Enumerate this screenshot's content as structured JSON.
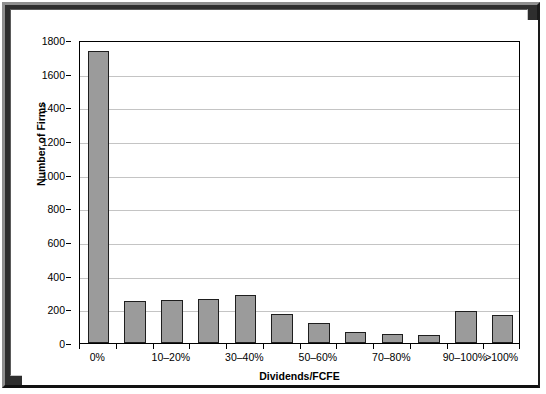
{
  "chart_data": {
    "type": "bar",
    "title": "",
    "xlabel": "Dividends/FCFE",
    "ylabel": "Number of Firms",
    "ylim": [
      0,
      1800
    ],
    "ytick_values": [
      0,
      200,
      400,
      600,
      800,
      1000,
      1200,
      1400,
      1600,
      1800
    ],
    "ytick_labels": [
      "0",
      "200",
      "400",
      "600",
      "800",
      "1000",
      "1200",
      "1400",
      "1600",
      "1800"
    ],
    "grid": true,
    "legend": false,
    "bar_color": "#9b9b9b",
    "bar_edge_color": "#1e1e1e",
    "categories": [
      "0%",
      "0-10%",
      "10-20%",
      "20-30%",
      "30-40%",
      "40-50%",
      "50-60%",
      "60-70%",
      "70-80%",
      "80-90%",
      "90-100%",
      ">100%"
    ],
    "visible_xtick_labels": [
      {
        "category_index": 0,
        "label": "0%"
      },
      {
        "category_index": 2,
        "label": "10–20%"
      },
      {
        "category_index": 4,
        "label": "30–40%"
      },
      {
        "category_index": 6,
        "label": "50–60%"
      },
      {
        "category_index": 8,
        "label": "70–80%"
      },
      {
        "category_index": 10,
        "label": "90–100%"
      },
      {
        "category_index": 11,
        "label": ">100%"
      }
    ],
    "values": [
      1735,
      250,
      255,
      260,
      285,
      175,
      120,
      65,
      55,
      45,
      190,
      165
    ]
  }
}
